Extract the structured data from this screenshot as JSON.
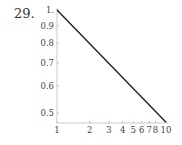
{
  "problem_number": "29.",
  "chart_data": {
    "type": "line",
    "title": "",
    "xlabel": "",
    "ylabel": "",
    "xscale": "log",
    "yscale": "log",
    "xlim": [
      1,
      10
    ],
    "ylim": [
      0.47,
      1
    ],
    "grid": false,
    "x_ticks": [
      "1",
      "2",
      "3",
      "4",
      "5",
      "6",
      "7",
      "8",
      "10"
    ],
    "x_tick_values": [
      1,
      2,
      3,
      4,
      5,
      6,
      7,
      8,
      10
    ],
    "y_ticks": [
      "1.",
      "0.9",
      "0.8",
      "0.7",
      "0.6",
      "0.5"
    ],
    "y_tick_values": [
      1,
      0.9,
      0.8,
      0.7,
      0.6,
      0.5
    ],
    "series": [
      {
        "name": "line",
        "x": [
          1,
          10
        ],
        "y": [
          1,
          0.47
        ],
        "color": "#222222"
      }
    ]
  }
}
